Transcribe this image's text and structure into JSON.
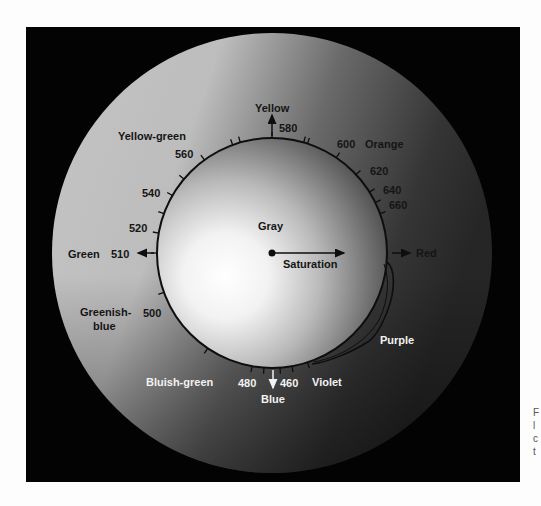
{
  "figure": {
    "center_label": "Gray",
    "saturation_label": "Saturation",
    "hues": {
      "yellow": "Yellow",
      "orange": "Orange",
      "red": "Red",
      "purple": "Purple",
      "violet": "Violet",
      "blue": "Blue",
      "bluish_green": "Bluish-green",
      "greenish_blue_line1": "Greenish-",
      "greenish_blue_line2": "blue",
      "green": "Green",
      "yellow_green": "Yellow-green"
    },
    "wavelengths": {
      "w580": "580",
      "w600": "600",
      "w620": "620",
      "w640": "640",
      "w660": "660",
      "w560": "560",
      "w540": "540",
      "w520": "520",
      "w510": "510",
      "w500": "500",
      "w480": "480",
      "w460": "460"
    },
    "colors": {
      "frame": "#030303",
      "outer_light": "#c9c9c9",
      "outer_dark": "#2a2a2a",
      "inner_highlight": "#ffffff",
      "line": "#0e0e0e"
    }
  },
  "caption": {
    "fragments": [
      "F",
      "l",
      "c",
      "t"
    ]
  }
}
